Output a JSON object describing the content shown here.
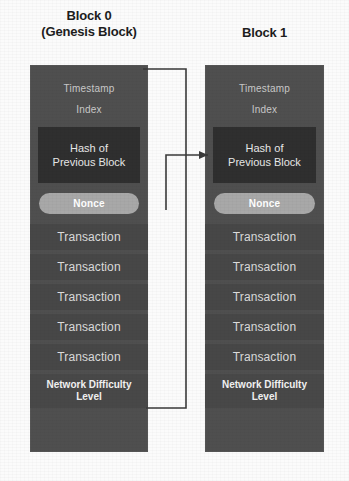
{
  "background_color": "#fbfbfb",
  "block_color": "#4f4f4f",
  "hash_color": "#2f2f2f",
  "nonce_color": "#a8a8a8",
  "connector_color": "#3a3a3a",
  "blocks": [
    {
      "title_line1": "Block 0",
      "title_line2": "(Genesis Block)",
      "timestamp_label": "Timestamp",
      "index_label": "Index",
      "hash_line1": "Hash of",
      "hash_line2": "Previous Block",
      "nonce_label": "Nonce",
      "transactions": [
        "Transaction",
        "Transaction",
        "Transaction",
        "Transaction",
        "Transaction"
      ],
      "difficulty_line1": "Network Difficulty",
      "difficulty_line2": "Level"
    },
    {
      "title_line1": "Block 1",
      "title_line2": "",
      "timestamp_label": "Timestamp",
      "index_label": "Index",
      "hash_line1": "Hash of",
      "hash_line2": "Previous Block",
      "nonce_label": "Nonce",
      "transactions": [
        "Transaction",
        "Transaction",
        "Transaction",
        "Transaction",
        "Transaction"
      ],
      "difficulty_line1": "Network Difficulty",
      "difficulty_line2": "Level"
    }
  ],
  "connectors": {
    "self_loop_name": "genesis-self-reference-connector",
    "chain_link_name": "block0-to-block1-hash-connector"
  }
}
